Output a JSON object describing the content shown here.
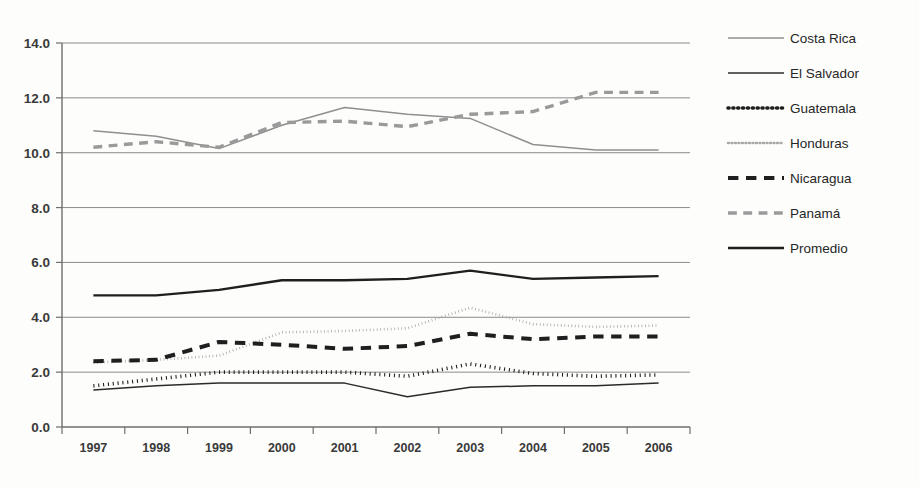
{
  "chart_data": {
    "type": "line",
    "title": "",
    "xlabel": "",
    "ylabel": "",
    "x": [
      1997,
      1998,
      1999,
      2000,
      2001,
      2002,
      2003,
      2004,
      2005,
      2006
    ],
    "categories": [
      "1997",
      "1998",
      "1999",
      "2000",
      "2001",
      "2002",
      "2003",
      "2004",
      "2005",
      "2006"
    ],
    "ylim": [
      0.0,
      14.0
    ],
    "ytick_values": [
      0.0,
      2.0,
      4.0,
      6.0,
      8.0,
      10.0,
      12.0,
      14.0
    ],
    "ytick_labels": [
      "0.0",
      "2.0",
      "4.0",
      "6.0",
      "8.0",
      "10.0",
      "12.0",
      "14.0"
    ],
    "grid": true,
    "legend_position": "right",
    "series": [
      {
        "name": "Costa Rica",
        "color": "#8f8f8f",
        "style": "solid",
        "width": 1.5,
        "values": [
          10.8,
          10.6,
          10.15,
          11.0,
          11.65,
          11.4,
          11.25,
          10.3,
          10.1,
          10.1
        ]
      },
      {
        "name": "El Salvador",
        "color": "#2b2b2b",
        "style": "solid",
        "width": 1.5,
        "values": [
          1.35,
          1.5,
          1.6,
          1.6,
          1.6,
          1.1,
          1.45,
          1.5,
          1.5,
          1.6
        ]
      },
      {
        "name": "Guatemala",
        "color": "#1f1f1f",
        "style": "dotted",
        "width": 3.6,
        "values": [
          1.5,
          1.75,
          2.0,
          2.0,
          2.0,
          1.85,
          2.3,
          1.95,
          1.85,
          1.9
        ]
      },
      {
        "name": "Honduras",
        "color": "#a8a8a8",
        "style": "dotted",
        "width": 2.6,
        "values": [
          2.35,
          2.45,
          2.6,
          3.45,
          3.5,
          3.6,
          4.35,
          3.75,
          3.65,
          3.7
        ]
      },
      {
        "name": "Nicaragua",
        "color": "#1f1f1f",
        "style": "dashed",
        "width": 4.0,
        "values": [
          2.4,
          2.45,
          3.1,
          3.0,
          2.85,
          2.95,
          3.4,
          3.2,
          3.3,
          3.3
        ]
      },
      {
        "name": "Panamá",
        "color": "#9a9a9a",
        "style": "dashed",
        "width": 3.4,
        "values": [
          10.2,
          10.4,
          10.2,
          11.1,
          11.15,
          10.95,
          11.4,
          11.5,
          12.2,
          12.2
        ]
      },
      {
        "name": "Promedio",
        "color": "#1f1f1f",
        "style": "solid",
        "width": 2.4,
        "values": [
          4.8,
          4.8,
          5.0,
          5.35,
          5.35,
          5.4,
          5.7,
          5.4,
          5.45,
          5.5
        ]
      }
    ]
  },
  "legend": {
    "items": [
      {
        "label": "Costa Rica"
      },
      {
        "label": "El Salvador"
      },
      {
        "label": "Guatemala"
      },
      {
        "label": "Honduras"
      },
      {
        "label": "Nicaragua"
      },
      {
        "label": "Panamá"
      },
      {
        "label": "Promedio"
      }
    ]
  }
}
